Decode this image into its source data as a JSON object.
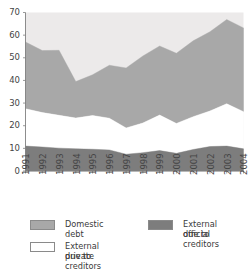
{
  "figure": {
    "title_fragment": "",
    "background": "#ffffff"
  },
  "legend": {
    "items": [
      {
        "label": "Domestic debt",
        "color": "#a8a8a8",
        "name": "legend-domestic-debt"
      },
      {
        "label": "External due to\nofficial creditors",
        "line1": "External due to",
        "line2": "official creditors",
        "color": "#7d7d7d",
        "name": "legend-external-official"
      },
      {
        "label": "External due to\nprivate creditors",
        "line1": "External due to",
        "line2": "private creditors",
        "color": "#ffffff",
        "name": "legend-external-private"
      }
    ]
  },
  "chart_data": {
    "type": "area",
    "stacked": true,
    "title": "",
    "xlabel": "",
    "ylabel": "",
    "ylim": [
      0,
      70
    ],
    "yticks": [
      0,
      10,
      20,
      30,
      40,
      50,
      60,
      70
    ],
    "grid": false,
    "legend_position": "bottom",
    "categories": [
      "1991",
      "1992",
      "1993",
      "1994",
      "1995",
      "1996",
      "1997",
      "1998",
      "1999",
      "2000",
      "2001",
      "2002",
      "2003",
      "2004"
    ],
    "series": [
      {
        "name": "External due to official creditors",
        "color": "#7d7d7d",
        "values": [
          11.0,
          10.6,
          10.1,
          9.8,
          9.6,
          9.3,
          7.4,
          8.1,
          9.0,
          7.8,
          9.5,
          10.8,
          11.0,
          9.8
        ]
      },
      {
        "name": "External due to private creditors",
        "color": "#ffffff",
        "values": [
          16.5,
          15.2,
          14.5,
          13.6,
          14.9,
          14.0,
          11.6,
          13.1,
          15.7,
          13.2,
          14.5,
          15.7,
          18.7,
          16.4
        ]
      },
      {
        "name": "Domestic debt",
        "color": "#a8a8a8",
        "values": [
          29.5,
          27.4,
          28.7,
          16.1,
          18.0,
          23.4,
          26.5,
          29.6,
          30.5,
          31.0,
          33.5,
          35.0,
          37.2,
          37.0
        ]
      }
    ],
    "cumulative_tops": {
      "official": [
        11.0,
        10.6,
        10.1,
        9.8,
        9.6,
        9.3,
        7.4,
        8.1,
        9.0,
        7.8,
        9.5,
        10.8,
        11.0,
        9.8
      ],
      "official_plus_private": [
        27.5,
        25.8,
        24.6,
        23.4,
        24.5,
        23.3,
        19.0,
        21.2,
        24.7,
        21.0,
        24.0,
        26.5,
        29.7,
        26.2
      ],
      "total": [
        57.0,
        53.2,
        53.3,
        39.5,
        42.5,
        46.7,
        45.5,
        50.8,
        55.2,
        52.0,
        57.5,
        61.5,
        66.9,
        63.2
      ]
    }
  }
}
